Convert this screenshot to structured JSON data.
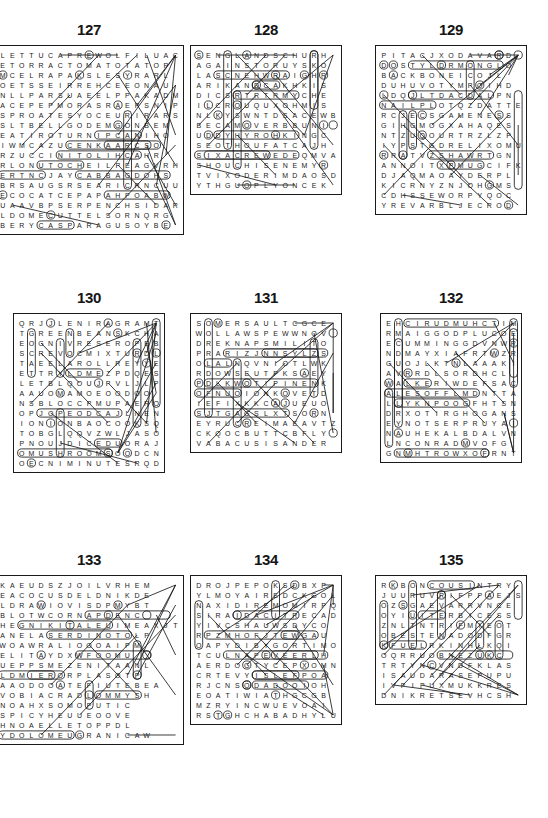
{
  "page": {
    "background_color": "#ffffff",
    "ink_color": "#1a1a1a",
    "footer_mark": ""
  },
  "puzzles": [
    {
      "number": "127",
      "cols": 16,
      "rows": 18,
      "rows_text": [
        "LETTUCAPREWOLFILUAC",
        "ETORRACTOMATOTATOP",
        "MCELRAPAKSLESYRARL",
        "OETSSEIRREHCEEONAU",
        "NLLPARSUAEELPPAKADM",
        "ACEPEPMORASRAEPSNIP",
        "SPROATESYOCEURIRARS",
        "SLTBELLGODEMGONBEM",
        "EATIROTURNIPCANIHO",
        "IWMCAZUCENKAARCSO",
        "RZUCCINITOLIHCAHR",
        "RLONUTOCHEILPEAGVRH",
        "ERTNCJAYCABBAGDOHS",
        "BRSAUGSRSEARICRNCUU",
        "ECOCATCEPAPAHPOABW",
        "UAAVBPSERPENCHSIDAR",
        "LDOMECUTTELSORNQRG",
        "BERYCASPARAGUSOYBE"
      ]
    },
    {
      "number": "128",
      "cols": 15,
      "rows": 15,
      "rows_text": [
        "SENGLANDSCHURH",
        "AGAINSTORUYSKO",
        "LASCNEHWRAIGHR",
        "ARIKANDCAKHKIS",
        "DICSRTRTRMYCHE",
        "ILCROUQUXOHMIS",
        "NLKYSWNTDSACEWB",
        "BECAMOVERBBUNI",
        "UDDYHYROHKINGC",
        "SEOTHOUFATCAJH",
        "SIXACREWEDEQMVA",
        "SHOUCHISENEMYR",
        "TVIXODERIMDAOSD",
        "YTHGUOPLYONCEK"
      ]
    },
    {
      "number": "129",
      "cols": 16,
      "rows": 16,
      "rows_text": [
        "PITACJXODAVARD",
        "DOSTYLDRMONGLO",
        "BACKBONEICOJL",
        "DUHUVOTYMPOIHD",
        "LDQJLTDACDALPN",
        "NAILPLOTQZDATTE",
        "RCJECSGAMENESS",
        "GIHGMOGXAHAQES",
        "NTZUQOURTRZLZP",
        "IYPSTGDRELIXOMU",
        "RRATVZSHAWRTGN",
        "ANNOITXPMUGCIFK",
        "DJAQMAOAYDERPL",
        "KICRNYZNJOHGMS",
        "CDHSSEWORPYQOC",
        "YREVARBLJECROD"
      ]
    },
    {
      "number": "130",
      "cols": 15,
      "rows": 16,
      "rows_text": [
        "QRJJLENIRAGRAMT",
        "TGREENBEANSKCHA",
        "EOGNIVRESEROPEB",
        "SCREVOCMIXTURDL",
        "TAEELAROLLREYYE",
        "ETTRYLDMEZPDQES",
        "LETBLQOUJPVLJLP",
        "AAUOMAMOEOODOO",
        "NSBLOCCPMUPAERO",
        "OPJOPEODCAJLNEN",
        "IONIONBAOCOOKSQ",
        "TOBGLQQVZWLJASO",
        "PNOUJDICEDUORAJ",
        "OMUSHROOMSOODCN",
        "OECNIMINUTESRQD"
      ]
    },
    {
      "number": "131",
      "cols": 14,
      "rows": 14,
      "rows_text": [
        "SOMERSAULTCGCE",
        "WOLLAWSPEWWNOV",
        "DREKNAPSMILITO",
        "PRARIZJNNSYLZS",
        "OLALNQVNIOTLWK",
        "RDOWSEUTPKSAEY",
        "PDLKWOTIPINENK",
        "OFNUOIONKOVETD",
        "IEFIXKKCAJUEUO",
        "SJTGAGSLXTSORN",
        "EYRUCREIMAEAVTZ",
        "CKQOCBUTTCBFLY",
        "VABACUSISANDER"
      ]
    },
    {
      "number": "132",
      "cols": 15,
      "rows": 15,
      "rows_text": [
        "EHCIRUDMUHCTIM",
        "RMAIGGODPLUCOE",
        "ECUMMINGGDVNWR",
        "NDMAYXIAFRTWZR",
        "GUOJLKTNLAAAKI",
        "AVRRDLSORDHCL",
        "WALKERIWDEFSAC",
        "ALESOFFLMDNTTA",
        "LLYKNPOOGFHTSN",
        "DRXOTIRGHOGANS",
        "EYNOTSERPRUYAI",
        "NAUHEKALBDALVN",
        "LNCONRADMVOFG",
        "GNMHTROWXOFRNT"
      ]
    },
    {
      "number": "133",
      "cols": 17,
      "rows": 18,
      "rows_text": [
        "KAEUDSZJOILVRHEM",
        "EACOCUSDELDNIKDE",
        "LDRAWIOVISDPMYBT",
        "BLOTWCORNAPDENC",
        "HEGNIKITALEUIMEAXJT",
        "ANELASERDINOTOLP",
        "WOAWRALIOOOAIPM",
        "ELITAYDXWFOOMU",
        "UEPPSMEZENITAANL",
        "LDMIERORPLASOTP",
        "AAODOOATEFIUTEBEA",
        "VOBIACRADLOMMYSH",
        "NOAHXSOMOPUTIC",
        "SPICYHEUUEOOVE",
        "HNOAELLETOPPDL",
        "YDOLOMEUGRANICAW"
      ]
    },
    {
      "number": "134",
      "cols": 15,
      "rows": 16,
      "rows_text": [
        "DROJPEPOKSDBXP",
        "YLMOYAIREDCKGOL",
        "NAXIDIREMOMIRPQ",
        "SIRAIDACITRECAD",
        "YIVCSHAUWSDYCO",
        "RPZMHOFJTEWGAU",
        "OAPYDIBYGORTIMO",
        "TCULNAPEVEERLH",
        "AERDOGTYCEPXOMN",
        "CRTEVYISLEFPOA",
        "RJCNSODADOOIOH",
        "EOATIWIATHGCGB",
        "MZRYINCWUEVOAI",
        "RSTGHCHABADHYLU"
      ]
    },
    {
      "number": "135",
      "cols": 15,
      "rows": 14,
      "rows_text": [
        "RKBONCOUSINTRY",
        "JUURUVRIFPPAEJS",
        "OZSGAEVARRVNCE",
        "OYIUITERBICESS",
        "ZNLTNTRIFMIEOT",
        "OBESTENADODFGR",
        "KFUELRKINHLKQI",
        "OQRRUOBNEZUKC",
        "TRTYNCVNDFKLAS",
        "ISAUDARASEPUPU",
        "IVPIPUXMUKKRES",
        "DNIKRETSEVHCSH"
      ]
    }
  ]
}
